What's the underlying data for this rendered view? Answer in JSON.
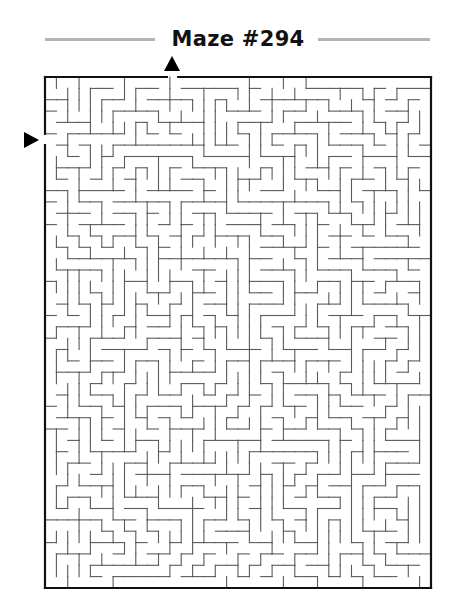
{
  "puzzle": {
    "title": "Maze #294",
    "entrance_markers": [
      {
        "id": "top",
        "direction": "down",
        "label": "start-top"
      },
      {
        "id": "left",
        "direction": "right",
        "label": "start-left"
      }
    ]
  },
  "maze": {
    "columns": 34,
    "rows": 45,
    "bounds": {
      "left": 45,
      "top": 77,
      "right": 431,
      "bottom": 588
    },
    "openings": [
      {
        "side": "top",
        "index": 11
      },
      {
        "side": "left",
        "index": 5
      }
    ],
    "seed": 294
  },
  "colors": {
    "border": "#111111",
    "wall": "#5a5a5a",
    "title_rule": "#b4b4b4",
    "arrow": "#000000",
    "background": "#ffffff"
  }
}
